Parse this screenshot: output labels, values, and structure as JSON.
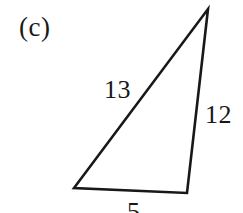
{
  "figure": {
    "part_label": "(c)",
    "shape": "triangle",
    "stroke_color": "#18181a",
    "background_color": "#ffffff",
    "stroke_width": 2.6,
    "vertices": {
      "apex": [
        208,
        9
      ],
      "bottom_left": [
        74,
        188
      ],
      "bottom_right": [
        187,
        193
      ]
    },
    "side_labels": {
      "hypotenuse": "13",
      "right_side": "12",
      "base": "5"
    }
  },
  "chart_data": {
    "type": "diagram",
    "title": "(c)",
    "shape": "triangle",
    "labels": [
      "13",
      "12",
      "5"
    ],
    "sides": [
      {
        "name": "hypotenuse",
        "value": 13,
        "from": "bottom_left",
        "to": "apex"
      },
      {
        "name": "right-side",
        "value": 12,
        "from": "apex",
        "to": "bottom_right"
      },
      {
        "name": "base",
        "value": 5,
        "from": "bottom_left",
        "to": "bottom_right"
      }
    ]
  }
}
